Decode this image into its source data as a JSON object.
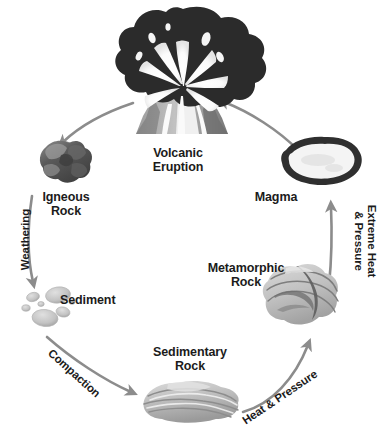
{
  "diagram": {
    "type": "cycle-diagram",
    "background_color": "#ffffff",
    "text_color": "#1b1b1b",
    "arrow_color": "#8c8c8c"
  },
  "nodes": {
    "volcanic_eruption": {
      "label": "Volcanic\nEruption",
      "icon": "volcano-icon",
      "colors": {
        "ash_cloud": "#2b2b2b",
        "eruption": "#f2f2f2",
        "cone_light": "#b9b9b9",
        "cone_dark": "#6e6e6e"
      }
    },
    "igneous_rock": {
      "label": "Igneous\nRock",
      "icon": "igneous-rock-icon",
      "colors": {
        "dark": "#4a4a4a",
        "mid": "#6f6f6f",
        "light": "#a3a3a3"
      }
    },
    "sediment": {
      "label": "Sediment",
      "icon": "sediment-pebbles-icon",
      "colors": {
        "pebble": "#c9c9c9",
        "pebble_shade": "#aaaaaa"
      }
    },
    "sedimentary_rock": {
      "label": "Sedimentary\nRock",
      "icon": "sedimentary-rock-icon",
      "colors": {
        "layer_light": "#d2d2d2",
        "layer_mid": "#b0b0b0",
        "layer_dark": "#8d8d8d"
      }
    },
    "metamorphic_rock": {
      "label": "Metamorphic\nRock",
      "icon": "metamorphic-rock-icon",
      "colors": {
        "body": "#c8c8c8",
        "band": "#7e7e7e",
        "band_dark": "#5f5f5f"
      }
    },
    "magma": {
      "label": "Magma",
      "icon": "magma-chamber-icon",
      "colors": {
        "rim": "#2f2f2f",
        "interior": "#f4f4f4"
      }
    }
  },
  "arrows": [
    {
      "id": "weathering",
      "label": "Weathering",
      "from": "igneous_rock",
      "to": "sediment",
      "rotation_deg": -90
    },
    {
      "id": "compaction",
      "label": "Compaction",
      "from": "sediment",
      "to": "sedimentary_rock",
      "rotation_deg": 42
    },
    {
      "id": "heat_pressure",
      "label": "Heat & Pressure",
      "from": "sedimentary_rock",
      "to": "metamorphic_rock",
      "rotation_deg": -34
    },
    {
      "id": "extreme_heat",
      "label": "Extreme Heat\n& Pressure",
      "from": "metamorphic_rock",
      "to": "magma",
      "rotation_deg": 90
    },
    {
      "id": "magma_to_volcano",
      "label": "",
      "from": "magma",
      "to": "volcanic_eruption",
      "rotation_deg": 0
    },
    {
      "id": "volcano_to_igneous",
      "label": "",
      "from": "volcanic_eruption",
      "to": "igneous_rock",
      "rotation_deg": 0
    }
  ]
}
